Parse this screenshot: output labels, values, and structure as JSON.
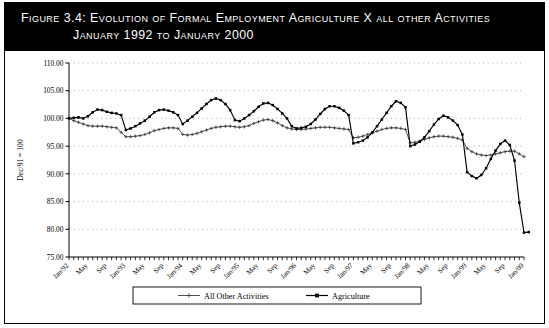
{
  "figure": {
    "title_line1": "Figure 3.4:  Evolution of Formal Employment Agriculture X all other Activities",
    "title_line2": "January 1992 to January 2000"
  },
  "legend": {
    "items": [
      {
        "label": "All Other Activities",
        "marker": "plus-marker",
        "color": "#3b3b3b"
      },
      {
        "label": "Agriculture",
        "marker": "square-marker",
        "color": "#000000"
      }
    ]
  },
  "colors": {
    "header_background": "#000000",
    "header_text": "#ffffff",
    "plot_background": "#ffffff",
    "grid": "#9a9a9a",
    "agriculture": "#000000",
    "all_other_activities": "#3b3b3b"
  },
  "chart_data": {
    "type": "line",
    "title": "Evolution of Formal Employment Agriculture X all other Activities January 1992 to January 2000",
    "xlabel": "",
    "ylabel": "Dec/91 = 100",
    "ylim": [
      75.0,
      110.0
    ],
    "yticks": [
      "75.00",
      "80.00",
      "85.00",
      "90.00",
      "95.00",
      "100.00",
      "105.00",
      "110.00"
    ],
    "ytick_values": [
      75.0,
      80.0,
      85.0,
      90.0,
      95.0,
      100.0,
      105.0,
      110.0
    ],
    "grid": true,
    "legend_position": "bottom",
    "x_tick_labels": [
      "Jan/92",
      "May",
      "Sep",
      "Jan/93",
      "May",
      "Sep",
      "Jan/94",
      "May",
      "Sep",
      "Jan/95",
      "May",
      "Sep",
      "Jan/96",
      "May",
      "Sep",
      "Jan/97",
      "May",
      "Sep",
      "Jan/98",
      "May",
      "Sep",
      "Jan/99",
      "May",
      "Sep",
      "Jan/00"
    ],
    "x_tick_index": [
      0,
      4,
      8,
      12,
      16,
      20,
      24,
      28,
      32,
      36,
      40,
      44,
      48,
      52,
      56,
      60,
      64,
      68,
      72,
      76,
      80,
      84,
      88,
      92,
      96
    ],
    "n_points": 97,
    "series": [
      {
        "name": "All Other Activities",
        "values": [
          100.0,
          99.6,
          99.3,
          99.0,
          98.7,
          98.6,
          98.6,
          98.6,
          98.5,
          98.4,
          98.3,
          97.5,
          96.7,
          96.7,
          96.8,
          96.9,
          97.1,
          97.4,
          97.8,
          98.0,
          98.2,
          98.3,
          98.3,
          98.2,
          97.1,
          97.0,
          97.1,
          97.3,
          97.6,
          97.9,
          98.2,
          98.4,
          98.5,
          98.6,
          98.6,
          98.5,
          98.4,
          98.5,
          98.7,
          99.1,
          99.4,
          99.7,
          99.8,
          99.6,
          99.2,
          98.7,
          98.3,
          98.1,
          98.0,
          98.0,
          98.1,
          98.2,
          98.3,
          98.4,
          98.4,
          98.4,
          98.3,
          98.2,
          98.1,
          98.0,
          96.5,
          96.6,
          96.8,
          97.1,
          97.4,
          97.7,
          98.0,
          98.2,
          98.3,
          98.3,
          98.2,
          98.0,
          95.6,
          95.7,
          95.9,
          96.2,
          96.5,
          96.7,
          96.8,
          96.8,
          96.7,
          96.6,
          96.4,
          96.1,
          94.6,
          94.0,
          93.6,
          93.4,
          93.3,
          93.4,
          93.6,
          93.8,
          94.0,
          94.1,
          94.1,
          93.6,
          93.1
        ]
      },
      {
        "name": "Agriculture",
        "values": [
          100.0,
          100.1,
          100.2,
          100.0,
          100.4,
          101.1,
          101.6,
          101.5,
          101.2,
          101.0,
          100.9,
          100.6,
          97.9,
          98.2,
          98.6,
          99.1,
          99.6,
          100.3,
          101.1,
          101.5,
          101.6,
          101.4,
          101.1,
          100.6,
          99.0,
          99.6,
          100.3,
          101.0,
          101.8,
          102.6,
          103.3,
          103.6,
          103.3,
          102.6,
          101.5,
          99.7,
          99.5,
          100.0,
          100.6,
          101.3,
          102.1,
          102.7,
          102.8,
          102.4,
          101.7,
          100.9,
          100.0,
          98.6,
          98.2,
          98.3,
          98.5,
          99.0,
          99.8,
          100.8,
          101.7,
          102.2,
          102.2,
          101.9,
          101.4,
          100.6,
          95.5,
          95.7,
          96.0,
          96.6,
          97.5,
          98.6,
          99.8,
          101.0,
          102.2,
          103.1,
          102.8,
          102.0,
          95.0,
          95.3,
          95.8,
          96.6,
          97.7,
          98.9,
          99.9,
          100.5,
          100.2,
          99.6,
          98.8,
          97.1,
          90.3,
          89.6,
          89.2,
          89.8,
          91.0,
          92.7,
          94.2,
          95.4,
          96.0,
          95.2,
          92.4,
          84.8,
          79.4,
          79.5
        ]
      }
    ]
  }
}
